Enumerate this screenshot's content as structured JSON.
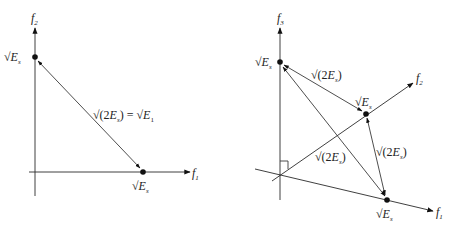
{
  "figure": {
    "left_panel": {
      "axes": {
        "vertical": {
          "label": "f",
          "sub": "2"
        },
        "horizontal": {
          "label": "f",
          "sub": "1"
        }
      },
      "points": [
        {
          "id": "p_f2",
          "label_prefix": "√",
          "label": "E",
          "sub": "s"
        },
        {
          "id": "p_f1",
          "label_prefix": "√",
          "label": "E",
          "sub": "s"
        }
      ],
      "distance_label": {
        "lhs_prefix": "√(2",
        "lhs_var": "E",
        "lhs_sub": "s",
        "lhs_suffix": ")",
        "equals": " = ",
        "rhs_prefix": "√",
        "rhs_var": "E",
        "rhs_sub": "1"
      }
    },
    "right_panel": {
      "axes": {
        "vertical": {
          "label": "f",
          "sub": "3"
        },
        "diag_up": {
          "label": "f",
          "sub": "2"
        },
        "diag_down": {
          "label": "f",
          "sub": "1"
        }
      },
      "points": [
        {
          "id": "p_f3",
          "label_prefix": "√",
          "label": "E",
          "sub": "s"
        },
        {
          "id": "p_f2",
          "label_prefix": "√",
          "label": "E",
          "sub": "s"
        },
        {
          "id": "p_f1",
          "label_prefix": "√",
          "label": "E",
          "sub": "s"
        }
      ],
      "edge_labels": [
        {
          "prefix": "√(2",
          "var": "E",
          "sub": "s",
          "suffix": ")"
        },
        {
          "prefix": "√(2",
          "var": "E",
          "sub": "s",
          "suffix": ")"
        },
        {
          "prefix": "√(2",
          "var": "E",
          "sub": "s",
          "suffix": ")"
        }
      ]
    }
  }
}
